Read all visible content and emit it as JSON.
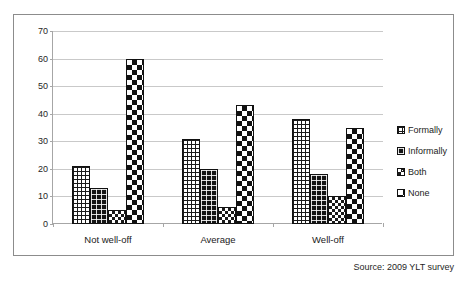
{
  "chart_data": {
    "type": "bar",
    "title": "",
    "subtitle": "",
    "xlabel": "",
    "ylabel": "",
    "ylim": [
      0,
      70
    ],
    "yticks": [
      0,
      10,
      20,
      30,
      40,
      50,
      60,
      70
    ],
    "grid": true,
    "legend_position": "right",
    "categories": [
      "Not well-off",
      "Average",
      "Well-off"
    ],
    "series": [
      {
        "name": "Formally",
        "values": [
          21,
          31,
          38
        ],
        "pattern": "fine-grid"
      },
      {
        "name": "Informally",
        "values": [
          13,
          20,
          18
        ],
        "pattern": "dark-dotted"
      },
      {
        "name": "Both",
        "values": [
          5,
          6,
          10
        ],
        "pattern": "small-checker"
      },
      {
        "name": "None",
        "values": [
          60,
          43,
          35
        ],
        "pattern": "large-checker"
      }
    ],
    "annotations": [
      "Source: 2009 YLT survey"
    ]
  },
  "legend": {
    "items": [
      {
        "label": "Formally"
      },
      {
        "label": "Informally"
      },
      {
        "label": "Both"
      },
      {
        "label": "None"
      }
    ]
  },
  "axes": {
    "y": {
      "ticks": [
        "0",
        "10",
        "20",
        "30",
        "40",
        "50",
        "60",
        "70"
      ]
    },
    "x": {
      "ticks": [
        "Not well-off",
        "Average",
        "Well-off"
      ]
    }
  },
  "footer": {
    "source": "Source: 2009 YLT survey"
  },
  "colors": {
    "ink": "#111111",
    "grid": "#c9c9c9",
    "axis": "#a6a6a6",
    "frame": "#8c8c8c",
    "background": "#ffffff"
  }
}
